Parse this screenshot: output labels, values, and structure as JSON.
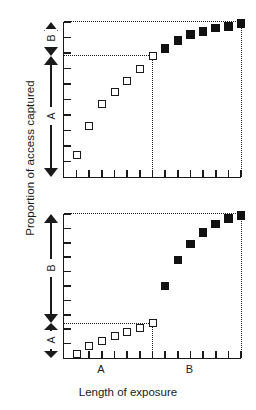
{
  "figure": {
    "axis_titles": {
      "y": "Proportion of access captured",
      "x": "Length of exposure"
    },
    "marker_legend": {
      "open_square": "period A exposure",
      "filled_square": "period B exposure"
    }
  },
  "chart_data": [
    {
      "type": "scatter",
      "panel": "top",
      "title": "",
      "xlabel": "Length of exposure",
      "ylabel": "Proportion of access captured",
      "xlim": [
        0,
        14
      ],
      "ylim": [
        0,
        1
      ],
      "grid": false,
      "legend": "none",
      "x_ticks": [
        1,
        2,
        3,
        4,
        5,
        6,
        7,
        8,
        9,
        10,
        11,
        12,
        13,
        14
      ],
      "x_tick_labels": [
        "",
        "",
        "",
        "",
        "",
        "",
        "",
        "",
        "",
        "",
        "",
        "",
        "",
        ""
      ],
      "y_ticks": [
        0.1,
        0.2,
        0.3,
        0.4,
        0.5,
        0.6,
        0.7,
        0.8,
        0.9,
        1.0
      ],
      "y_tick_labels": [
        "",
        "",
        "",
        "",
        "",
        "",
        "",
        "",
        "",
        ""
      ],
      "series": [
        {
          "name": "open_square",
          "marker": "open-square",
          "x": [
            1,
            2,
            3,
            4,
            5,
            6,
            7
          ],
          "values": [
            0.14,
            0.33,
            0.47,
            0.55,
            0.62,
            0.7,
            0.78
          ]
        },
        {
          "name": "filled_square",
          "marker": "filled-square",
          "x": [
            8,
            9,
            10,
            11,
            12,
            13,
            14
          ],
          "values": [
            0.83,
            0.88,
            0.92,
            0.94,
            0.96,
            0.97,
            0.99
          ]
        }
      ],
      "reference_lines": [
        {
          "orient": "horizontal",
          "value": 0.78
        },
        {
          "orient": "vertical",
          "value": 7
        },
        {
          "orient": "vertical",
          "value": 14
        },
        {
          "orient": "horizontal",
          "value": 1.0
        }
      ],
      "brackets": [
        {
          "label": "B",
          "from": 0.78,
          "to": 1.0,
          "size": "small"
        },
        {
          "label": "A",
          "from": 0.0,
          "to": 0.78,
          "size": "large"
        }
      ]
    },
    {
      "type": "scatter",
      "panel": "bottom",
      "title": "",
      "xlabel": "Length of exposure",
      "ylabel": "Proportion of access captured",
      "xlim": [
        0,
        14
      ],
      "ylim": [
        0,
        1
      ],
      "grid": false,
      "legend": "none",
      "x_ticks": [
        1,
        2,
        3,
        4,
        5,
        6,
        7,
        8,
        9,
        10,
        11,
        12,
        13,
        14
      ],
      "x_tick_labels": [
        "",
        "",
        "A",
        "",
        "",
        "",
        "",
        "",
        "",
        "B",
        "",
        "",
        "",
        ""
      ],
      "y_ticks": [
        0.1,
        0.2,
        0.3,
        0.4,
        0.5,
        0.6,
        0.7,
        0.8,
        0.9,
        1.0
      ],
      "y_tick_labels": [
        "",
        "",
        "",
        "",
        "",
        "",
        "",
        "",
        "",
        ""
      ],
      "series": [
        {
          "name": "open_square",
          "marker": "open-square",
          "x": [
            1,
            2,
            3,
            4,
            5,
            6,
            7
          ],
          "values": [
            0.03,
            0.08,
            0.12,
            0.15,
            0.18,
            0.21,
            0.24
          ]
        },
        {
          "name": "filled_square",
          "marker": "filled-square",
          "x": [
            8,
            9,
            10,
            11,
            12,
            13,
            14
          ],
          "values": [
            0.5,
            0.68,
            0.79,
            0.87,
            0.93,
            0.97,
            0.99
          ]
        }
      ],
      "reference_lines": [
        {
          "orient": "horizontal",
          "value": 0.24
        },
        {
          "orient": "vertical",
          "value": 7
        },
        {
          "orient": "vertical",
          "value": 14
        },
        {
          "orient": "horizontal",
          "value": 1.0
        }
      ],
      "brackets": [
        {
          "label": "B",
          "from": 0.24,
          "to": 1.0,
          "size": "large"
        },
        {
          "label": "A",
          "from": 0.0,
          "to": 0.24,
          "size": "small"
        }
      ],
      "x_category_labels": [
        {
          "label": "A",
          "at": 3
        },
        {
          "label": "B",
          "at": 10
        }
      ]
    }
  ]
}
